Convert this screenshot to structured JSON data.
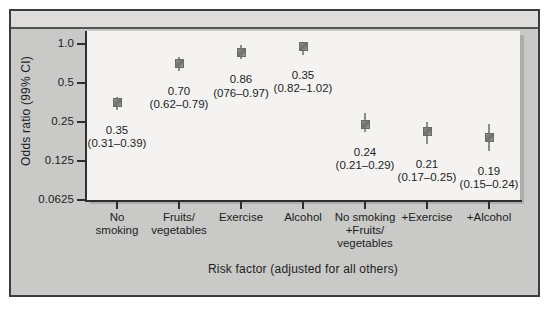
{
  "chart_data": {
    "type": "scatter",
    "title": "",
    "subtitle": "",
    "xlabel": "Risk factor (adjusted for all others)",
    "ylabel": "Odds ratio (99% CI)",
    "yscale": "log",
    "ylim": [
      0.0625,
      1.25
    ],
    "ytick_labels": [
      "1.0",
      "0.5",
      "0.25",
      "0.125",
      "0.0625"
    ],
    "ytick_values": [
      1.0,
      0.5,
      0.25,
      0.125,
      0.0625
    ],
    "grid": false,
    "legend": "none",
    "categories": [
      "No smoking",
      "Fruits/ vegetables",
      "Exercise",
      "Alcohol",
      "No smoking +Fruits/ vegetables",
      "+Exercise",
      "+Alcohol"
    ],
    "values": [
      0.35,
      0.7,
      0.86,
      0.95,
      0.24,
      0.21,
      0.19
    ],
    "ci_low": [
      0.31,
      0.62,
      0.76,
      0.82,
      0.21,
      0.17,
      0.15
    ],
    "ci_high": [
      0.39,
      0.79,
      0.97,
      1.02,
      0.29,
      0.25,
      0.24
    ],
    "points": [
      {
        "category_lines": [
          "No",
          "smoking"
        ],
        "estimate_label": "0.35",
        "ci_label": "(0.31–0.39)",
        "value": 0.35,
        "ci_low": 0.31,
        "ci_high": 0.39
      },
      {
        "category_lines": [
          "Fruits/",
          "vegetables"
        ],
        "estimate_label": "0.70",
        "ci_label": "(0.62–0.79)",
        "value": 0.7,
        "ci_low": 0.62,
        "ci_high": 0.79
      },
      {
        "category_lines": [
          "Exercise"
        ],
        "estimate_label": "0.86",
        "ci_label": "(076–0.97)",
        "value": 0.86,
        "ci_low": 0.76,
        "ci_high": 0.97
      },
      {
        "category_lines": [
          "Alcohol"
        ],
        "estimate_label": "0.35",
        "ci_label": "(0.82–1.02)",
        "value": 0.95,
        "ci_low": 0.82,
        "ci_high": 1.02
      },
      {
        "category_lines": [
          "No smoking",
          "+Fruits/",
          "vegetables"
        ],
        "estimate_label": "0.24",
        "ci_label": "(0.21–0.29)",
        "value": 0.24,
        "ci_low": 0.21,
        "ci_high": 0.29
      },
      {
        "category_lines": [
          "+Exercise"
        ],
        "estimate_label": "0.21",
        "ci_label": "(0.17–0.25)",
        "value": 0.21,
        "ci_low": 0.17,
        "ci_high": 0.25
      },
      {
        "category_lines": [
          "+Alcohol"
        ],
        "estimate_label": "0.19",
        "ci_label": "(0.15–0.24)",
        "value": 0.19,
        "ci_low": 0.15,
        "ci_high": 0.24
      }
    ]
  },
  "colors": {
    "panel_background": "#c9c9c7",
    "panel_top_band": "#dedddb",
    "panel_border": "#3c3c3c",
    "plot_background": "#f4f3f1",
    "axis": "#2e2e2e",
    "marker": "#7b7b79",
    "text": "#1d1d1d"
  }
}
